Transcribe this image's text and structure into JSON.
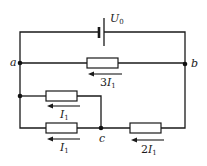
{
  "diagram": {
    "type": "electric-circuit",
    "source": {
      "label": "U",
      "subscript": "0"
    },
    "nodes": [
      {
        "id": "a",
        "label": "a"
      },
      {
        "id": "b",
        "label": "b"
      },
      {
        "id": "c",
        "label": "c"
      }
    ],
    "branches": [
      {
        "id": "ab-resistor",
        "between": [
          "b",
          "a"
        ],
        "current_coef": "3",
        "current_symbol": "I",
        "current_sub": "1",
        "direction": "left"
      },
      {
        "id": "upper-parallel-resistor",
        "between": [
          "c",
          "a"
        ],
        "current_coef": "",
        "current_symbol": "I",
        "current_sub": "1",
        "direction": "left"
      },
      {
        "id": "lower-parallel-resistor",
        "between": [
          "c",
          "a"
        ],
        "current_coef": "",
        "current_symbol": "I",
        "current_sub": "1",
        "direction": "left"
      },
      {
        "id": "bc-resistor",
        "between": [
          "b",
          "c"
        ],
        "current_coef": "2",
        "current_symbol": "I",
        "current_sub": "1",
        "direction": "left"
      }
    ],
    "colors": {
      "ink": "#1a1a1a",
      "background": "#ffffff"
    }
  }
}
